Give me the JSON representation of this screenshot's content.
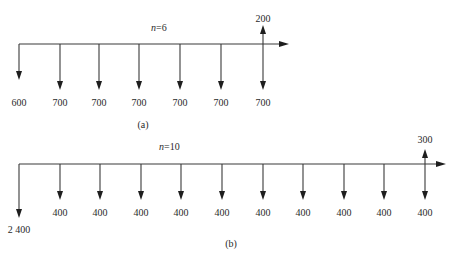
{
  "diagrams": [
    {
      "id": "a",
      "caption": "(a)",
      "period_label": "n=6",
      "period_var": "n",
      "period_value": "=6",
      "axis": {
        "y": 44,
        "x_start": 19,
        "x_end": 289
      },
      "caption_pos": {
        "x": 143,
        "y": 128
      },
      "period_pos": {
        "x": 151,
        "y": 31
      },
      "flows": [
        {
          "period": 0,
          "x": 19,
          "direction": "down",
          "amount": "600",
          "tip_y": 80,
          "label_y": 106
        },
        {
          "period": 1,
          "x": 60,
          "direction": "down",
          "amount": "700",
          "tip_y": 90,
          "label_y": 106
        },
        {
          "period": 2,
          "x": 99,
          "direction": "down",
          "amount": "700",
          "tip_y": 90,
          "label_y": 106
        },
        {
          "period": 3,
          "x": 139,
          "direction": "down",
          "amount": "700",
          "tip_y": 90,
          "label_y": 106
        },
        {
          "period": 4,
          "x": 180,
          "direction": "down",
          "amount": "700",
          "tip_y": 90,
          "label_y": 106
        },
        {
          "period": 5,
          "x": 221,
          "direction": "down",
          "amount": "700",
          "tip_y": 90,
          "label_y": 106
        },
        {
          "period": 6,
          "x": 263,
          "direction": "down",
          "amount": "700",
          "tip_y": 90,
          "label_y": 106
        },
        {
          "period": 6,
          "x": 263,
          "direction": "up",
          "amount": "200",
          "tip_y": 25,
          "label_y": 22
        }
      ]
    },
    {
      "id": "b",
      "caption": "(b)",
      "period_label": "n=10",
      "period_var": "n",
      "period_value": "=10",
      "axis": {
        "y": 164,
        "x_start": 19,
        "x_end": 446
      },
      "caption_pos": {
        "x": 231,
        "y": 247
      },
      "period_pos": {
        "x": 159,
        "y": 150
      },
      "flows": [
        {
          "period": 0,
          "x": 19,
          "direction": "down",
          "amount": "2 400",
          "tip_y": 218,
          "label_y": 233
        },
        {
          "period": 1,
          "x": 60,
          "direction": "down",
          "amount": "400",
          "tip_y": 200,
          "label_y": 216
        },
        {
          "period": 2,
          "x": 100,
          "direction": "down",
          "amount": "400",
          "tip_y": 200,
          "label_y": 216
        },
        {
          "period": 3,
          "x": 141,
          "direction": "down",
          "amount": "400",
          "tip_y": 200,
          "label_y": 216
        },
        {
          "period": 4,
          "x": 181,
          "direction": "down",
          "amount": "400",
          "tip_y": 200,
          "label_y": 216
        },
        {
          "period": 5,
          "x": 222,
          "direction": "down",
          "amount": "400",
          "tip_y": 200,
          "label_y": 216
        },
        {
          "period": 6,
          "x": 263,
          "direction": "down",
          "amount": "400",
          "tip_y": 200,
          "label_y": 216
        },
        {
          "period": 7,
          "x": 303,
          "direction": "down",
          "amount": "400",
          "tip_y": 200,
          "label_y": 216
        },
        {
          "period": 8,
          "x": 344,
          "direction": "down",
          "amount": "400",
          "tip_y": 200,
          "label_y": 216
        },
        {
          "period": 9,
          "x": 384,
          "direction": "down",
          "amount": "400",
          "tip_y": 200,
          "label_y": 216
        },
        {
          "period": 10,
          "x": 425,
          "direction": "down",
          "amount": "400",
          "tip_y": 200,
          "label_y": 216
        },
        {
          "period": 10,
          "x": 425,
          "direction": "up",
          "amount": "300",
          "tip_y": 149,
          "label_y": 143
        }
      ]
    }
  ],
  "colors": {
    "line": "#3a3a3a",
    "arrowhead": "#1e1e1e",
    "text": "#2a2a2a",
    "background": "#ffffff"
  }
}
